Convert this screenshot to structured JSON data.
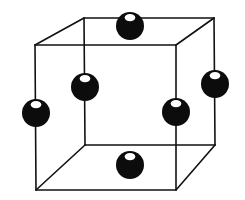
{
  "diagram": {
    "type": "crystal-lattice-unit-cell",
    "colors": {
      "background": "#ffffff",
      "edge": "#111111",
      "atom": "#0c0c0c",
      "highlight": "#ffffff"
    },
    "vertices": {
      "front_top_left": [
        35,
        45
      ],
      "front_top_right": [
        176,
        45
      ],
      "front_bottom_left": [
        36,
        190
      ],
      "front_bottom_right": [
        176,
        190
      ],
      "back_top_left": [
        84,
        18
      ],
      "back_top_right": [
        214,
        18
      ],
      "back_bottom_left": [
        85,
        145
      ],
      "back_bottom_right": [
        215,
        145
      ]
    },
    "edges": [
      [
        "front_top_left",
        "front_top_right"
      ],
      [
        "front_top_right",
        "front_bottom_right"
      ],
      [
        "front_bottom_right",
        "front_bottom_left"
      ],
      [
        "front_bottom_left",
        "front_top_left"
      ],
      [
        "back_top_left",
        "back_top_right"
      ],
      [
        "back_top_right",
        "back_bottom_right"
      ],
      [
        "back_bottom_right",
        "back_bottom_left"
      ],
      [
        "back_bottom_left",
        "back_top_left"
      ],
      [
        "front_top_left",
        "back_top_left"
      ],
      [
        "front_top_right",
        "back_top_right"
      ],
      [
        "front_bottom_left",
        "back_bottom_left"
      ],
      [
        "front_bottom_right",
        "back_bottom_right"
      ]
    ],
    "atoms": [
      {
        "name": "atom-top-face",
        "cx": 130,
        "cy": 26,
        "r": 14
      },
      {
        "name": "atom-back-face",
        "cx": 85,
        "cy": 87,
        "r": 14
      },
      {
        "name": "atom-right-face",
        "cx": 215,
        "cy": 84,
        "r": 14
      },
      {
        "name": "atom-left-face",
        "cx": 36,
        "cy": 113,
        "r": 14
      },
      {
        "name": "atom-front-face",
        "cx": 176,
        "cy": 112,
        "r": 14
      },
      {
        "name": "atom-bottom-face",
        "cx": 130,
        "cy": 165,
        "r": 14
      }
    ]
  }
}
